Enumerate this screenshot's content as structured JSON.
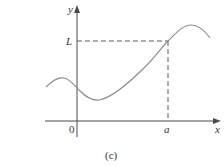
{
  "figure": {
    "caption": "(c)",
    "axes": {
      "x_label": "x",
      "y_label": "y",
      "origin_label": "0"
    },
    "markers": {
      "x_point_label": "a",
      "y_level_label": "L"
    },
    "colors": {
      "axis": "#4a4a4a",
      "curve": "#8a8a8a",
      "dashed": "#5a5a5a",
      "text": "#333333"
    }
  }
}
